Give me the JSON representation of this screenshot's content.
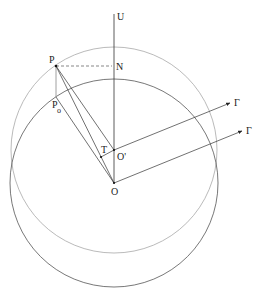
{
  "diagram": {
    "labels": {
      "U": "U",
      "P": "P",
      "N": "N",
      "P0_main": "P",
      "P0_sub": "o",
      "T": "T",
      "O_prime": "O'",
      "O": "O",
      "gamma1": "Γ",
      "gamma2": "Γ"
    },
    "colors": {
      "line": "#333333",
      "outer_circle": "#9a9a9a",
      "inner_circle": "#555555",
      "dashed": "#555555"
    }
  }
}
